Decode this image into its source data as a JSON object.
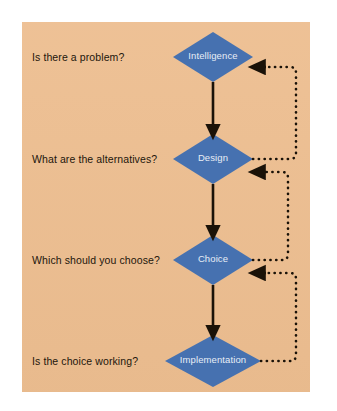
{
  "figure": {
    "panel_bg": "#edbe90",
    "page_bg": "#ffffff",
    "node_fill": "#4671b0",
    "node_text_color": "#e8eef6",
    "label_text_color": "#23160c",
    "arrow_color": "#1a1208"
  },
  "nodes": [
    {
      "id": "intelligence",
      "label": "Intelligence",
      "cx": 213,
      "cy": 57,
      "rx": 40,
      "ry": 25
    },
    {
      "id": "design",
      "label": "Design",
      "cx": 213,
      "cy": 159,
      "rx": 40,
      "ry": 25
    },
    {
      "id": "choice",
      "label": "Choice",
      "cx": 213,
      "cy": 260,
      "rx": 40,
      "ry": 25
    },
    {
      "id": "implementation",
      "label": "Implementation",
      "cx": 213,
      "cy": 361,
      "rx": 48,
      "ry": 26
    }
  ],
  "questions": [
    {
      "id": "q-intelligence",
      "text": "Is there a problem?",
      "x": 32,
      "y": 51
    },
    {
      "id": "q-design",
      "text": "What are the alternatives?",
      "x": 32,
      "y": 153
    },
    {
      "id": "q-choice",
      "text": "Which should you choose?",
      "x": 32,
      "y": 254
    },
    {
      "id": "q-implementation",
      "text": "Is the choice working?",
      "x": 32,
      "y": 355
    }
  ],
  "flow_arrows": [
    {
      "id": "intelligence-to-design",
      "from": "intelligence",
      "to": "design",
      "x": 213,
      "y1": 82,
      "y2": 132
    },
    {
      "id": "design-to-choice",
      "from": "design",
      "to": "choice",
      "x": 213,
      "y1": 184,
      "y2": 233
    },
    {
      "id": "choice-to-implementation",
      "from": "choice",
      "to": "implementation",
      "x": 213,
      "y1": 285,
      "y2": 333
    }
  ],
  "feedback_loops": [
    {
      "id": "design-to-intelligence",
      "from": "design",
      "to": "intelligence",
      "out_x": 253,
      "out_y": 159,
      "corner_x": 296,
      "up_to_y": 67,
      "arrow_x": 257,
      "arrow_y": 67
    },
    {
      "id": "choice-to-design",
      "from": "choice",
      "to": "design",
      "out_x": 253,
      "out_y": 260,
      "corner_x": 288,
      "up_to_y": 172,
      "arrow_x": 257,
      "arrow_y": 172
    },
    {
      "id": "implementation-to-choice",
      "from": "implementation",
      "to": "choice",
      "out_x": 261,
      "out_y": 361,
      "corner_x": 296,
      "up_to_y": 273,
      "arrow_x": 257,
      "arrow_y": 273
    }
  ]
}
